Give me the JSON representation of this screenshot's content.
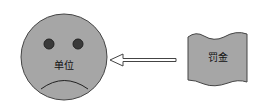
{
  "diagram": {
    "face": {
      "label": "单位",
      "fill": "#a6a6a6",
      "stroke": "#333333"
    },
    "arrow": {
      "direction": "left",
      "style": "hollow"
    },
    "flag": {
      "label": "罚金",
      "fill": "#a6a6a6",
      "stroke": "#333333"
    }
  }
}
